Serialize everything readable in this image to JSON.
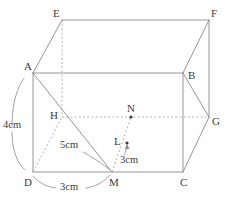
{
  "figure": {
    "kind": "cuboid-net-geometry-diagram",
    "stroke_color": "#8a8a8a",
    "dashed_color": "#a8a8a8",
    "label_color": "#3c3c3c",
    "background": "#ffffff"
  },
  "vertices": [
    {
      "name": "A",
      "label": "A",
      "x": 33,
      "y": 73,
      "label_x": 24,
      "label_y": 70,
      "hidden": false
    },
    {
      "name": "B",
      "label": "B",
      "x": 183,
      "y": 73,
      "label_x": 188,
      "label_y": 79,
      "hidden": false
    },
    {
      "name": "C",
      "label": "C",
      "x": 183,
      "y": 172,
      "label_x": 180,
      "label_y": 186,
      "hidden": false
    },
    {
      "name": "D",
      "label": "D",
      "x": 33,
      "y": 172,
      "label_x": 24,
      "label_y": 186,
      "hidden": false
    },
    {
      "name": "E",
      "label": "E",
      "x": 62,
      "y": 20,
      "label_x": 53,
      "label_y": 17,
      "hidden": false
    },
    {
      "name": "F",
      "label": "F",
      "x": 209,
      "y": 20,
      "label_x": 211,
      "label_y": 17,
      "hidden": false
    },
    {
      "name": "G",
      "label": "G",
      "x": 209,
      "y": 117,
      "label_x": 212,
      "label_y": 125,
      "hidden": false
    },
    {
      "name": "H",
      "label": "H",
      "x": 62,
      "y": 117,
      "label_x": 50,
      "label_y": 119,
      "hidden": true
    }
  ],
  "points": [
    {
      "name": "M",
      "label": "M",
      "x": 112,
      "y": 172,
      "label_x": 109,
      "label_y": 186,
      "dot": false
    },
    {
      "name": "N",
      "label": "N",
      "x": 131,
      "y": 117,
      "label_x": 127,
      "label_y": 112,
      "dot": true
    },
    {
      "name": "L",
      "label": "L",
      "x": 127,
      "y": 143,
      "label_x": 114,
      "label_y": 145,
      "dot": true
    }
  ],
  "solid_edges": [
    {
      "name": "edge-A-B",
      "from": "A",
      "to": "B"
    },
    {
      "name": "edge-B-C",
      "from": "B",
      "to": "C"
    },
    {
      "name": "edge-C-D",
      "from": "C",
      "to": "D"
    },
    {
      "name": "edge-D-A",
      "from": "D",
      "to": "A"
    },
    {
      "name": "edge-E-F",
      "from": "E",
      "to": "F"
    },
    {
      "name": "edge-F-G",
      "from": "F",
      "to": "G"
    },
    {
      "name": "edge-A-E",
      "from": "A",
      "to": "E"
    },
    {
      "name": "edge-B-F",
      "from": "B",
      "to": "F"
    },
    {
      "name": "edge-C-G",
      "from": "C",
      "to": "G"
    },
    {
      "name": "edge-B-G",
      "from": "B",
      "to": "G"
    },
    {
      "name": "edge-A-M",
      "from": "A",
      "to": "M"
    }
  ],
  "dashed_edges": [
    {
      "name": "edge-E-H",
      "from": "E",
      "to": "H"
    },
    {
      "name": "edge-H-G",
      "from": "H",
      "to": "G"
    },
    {
      "name": "edge-D-H",
      "from": "D",
      "to": "H"
    },
    {
      "name": "edge-M-N",
      "from": "M",
      "to": "N"
    }
  ],
  "measurements": [
    {
      "name": "measure-4cm-AD",
      "text": "4cm",
      "label_x": 3,
      "label_y": 128,
      "brace": "M 24 78 C 14 92 12 112 12 126 M 12 132 C 12 148 16 162 25 170"
    },
    {
      "name": "measure-5cm-to-M",
      "text": "5cm",
      "label_x": 60,
      "label_y": 148,
      "leader": "M 83 152 C 94 158 104 165 110 170"
    },
    {
      "name": "measure-3cm-DM",
      "text": "3cm",
      "label_x": 60,
      "label_y": 190,
      "arc_left": "M 33 176 C 40 184 48 187 56 188",
      "arc_right": "M 86 188 C 95 187 104 182 110 175"
    },
    {
      "name": "measure-3cm-to-L",
      "text": "3cm",
      "label_x": 120,
      "label_y": 163,
      "arrow": "M 124 155 C 126 151 127 148 127 145"
    }
  ]
}
